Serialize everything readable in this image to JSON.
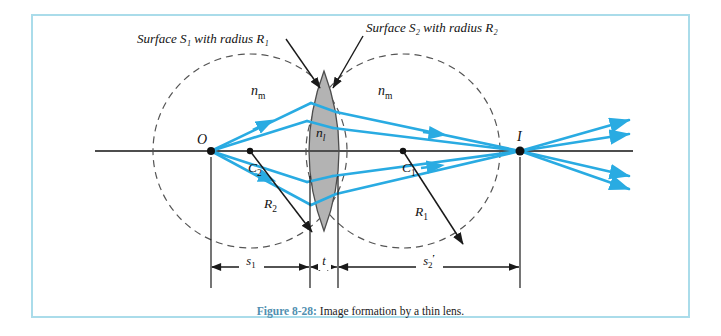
{
  "figure": {
    "caption_label": "Figure 8-28:",
    "caption_text": "Image formation by a thin lens.",
    "frame_color": "#aadcea",
    "ray_color": "#29abe2",
    "axis_color": "#4d4d4d",
    "lens_fill": "#b3b3b3",
    "dashed_color": "#555555"
  },
  "annotations": {
    "surface1": "Surface S₁ with radius R₁",
    "surface2": "Surface S₂ with radius R₂",
    "medium_left": "n",
    "medium_left_sub": "m",
    "medium_right": "n",
    "medium_right_sub": "m",
    "lens_index": "n",
    "lens_index_sub": "l"
  },
  "points": {
    "object": "O",
    "image": "I",
    "center1": "C",
    "center1_sub": "1",
    "center2": "C",
    "center2_sub": "2"
  },
  "radii": {
    "r1": "R",
    "r1_sub": "1",
    "r2": "R",
    "r2_sub": "2"
  },
  "dimensions": {
    "s1": "s",
    "s1_sub": "1",
    "thickness": "t",
    "s2prime": "s",
    "s2prime_sub": "2",
    "s2prime_mark": "′"
  }
}
